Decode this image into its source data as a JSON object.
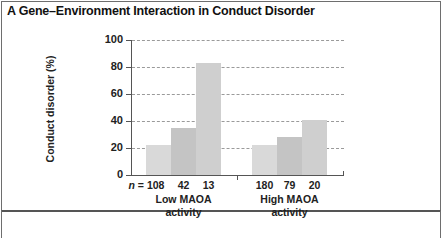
{
  "chart_data": {
    "type": "bar",
    "title": "A Gene–Environment Interaction in Conduct Disorder",
    "xlabel": "",
    "ylabel": "Conduct disorder (%)",
    "ylim": [
      0,
      100
    ],
    "yticks": [
      0,
      20,
      40,
      60,
      80,
      100
    ],
    "grid": true,
    "groups": [
      {
        "label": "Low MAOA activity",
        "label_lines": [
          "Low MAOA",
          "activity"
        ],
        "bars": [
          {
            "n_label": "n = 108",
            "n": 108,
            "value": 22,
            "color": "#d9d9d9"
          },
          {
            "n_label": "42",
            "n": 42,
            "value": 35,
            "color": "#c4c4c4"
          },
          {
            "n_label": "13",
            "n": 13,
            "value": 83,
            "color": "#cfcfcf"
          }
        ]
      },
      {
        "label": "High MAOA activity",
        "label_lines": [
          "High MAOA",
          "activity"
        ],
        "bars": [
          {
            "n_label": "180",
            "n": 180,
            "value": 22,
            "color": "#d9d9d9"
          },
          {
            "n_label": "79",
            "n": 79,
            "value": 28,
            "color": "#c4c4c4"
          },
          {
            "n_label": "20",
            "n": 20,
            "value": 41,
            "color": "#cfcfcf"
          }
        ]
      }
    ]
  }
}
